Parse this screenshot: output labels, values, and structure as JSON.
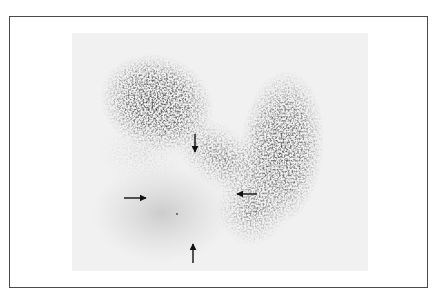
{
  "figure": {
    "type": "scintigraphy-scan",
    "background_color": "#f1f1f1",
    "uptake_color": "#2e2e2e",
    "border_color": "#4a4a4a",
    "arrows": [
      {
        "id": "arrow-right-pointing",
        "direction": "right",
        "x1": 124,
        "y1": 198,
        "x2": 146,
        "y2": 198
      },
      {
        "id": "arrow-down-pointing",
        "direction": "down",
        "x1": 195,
        "y1": 134,
        "x2": 195,
        "y2": 152
      },
      {
        "id": "arrow-left-pointing",
        "direction": "left",
        "x1": 257,
        "y1": 194,
        "x2": 237,
        "y2": 194
      },
      {
        "id": "arrow-up-pointing",
        "direction": "up",
        "x1": 193,
        "y1": 263,
        "x2": 193,
        "y2": 244
      }
    ]
  }
}
